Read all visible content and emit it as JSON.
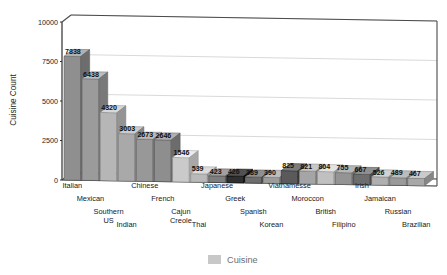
{
  "chart_data": {
    "type": "bar",
    "title": "",
    "subtitle": "",
    "xlabel": "Cuisine",
    "ylabel": "Cuisine Count",
    "ylim": [
      0,
      10000
    ],
    "yticks": [
      0,
      2500,
      5000,
      7500,
      10000
    ],
    "ytick_labels": [
      "0",
      "2500",
      "5000",
      "7500",
      "10000"
    ],
    "grid": true,
    "legend_position": "bottom",
    "legend": [
      "Cuisine"
    ],
    "style": "3d-bar",
    "categories": [
      "Italian",
      "Mexican",
      "Southern US",
      "Indian",
      "Chinese",
      "French",
      "Cajun Creole",
      "Thai",
      "Japanese",
      "Greek",
      "Spanish",
      "Korean",
      "Viatnamesse",
      "Moroccon",
      "British",
      "Filipino",
      "Irish",
      "Jamaican",
      "Russian",
      "Brazilian"
    ],
    "values": [
      7838,
      6438,
      4320,
      3003,
      2673,
      2646,
      1546,
      539,
      423,
      426,
      389,
      390,
      825,
      821,
      804,
      755,
      667,
      526,
      489,
      467
    ],
    "value_labels": [
      "7838",
      "6438",
      "4320",
      "3003",
      "2673",
      "2646",
      "1546",
      "539",
      "423",
      "426",
      "389",
      "390",
      "825",
      "821",
      "804",
      "755",
      "667",
      "526",
      "489",
      "467"
    ],
    "bar_colors": [
      "#8f8f8f",
      "#9b9b9b",
      "#b6b6b6",
      "#a9a9a9",
      "#989898",
      "#8e8e8e",
      "#cacaca",
      "#b9b9b9",
      "#7e7e7e",
      "#2f2f2f",
      "#6e6e6e",
      "#9c9c9c",
      "#5a5a5a",
      "#a5a5a5",
      "#c0c0c0",
      "#949494",
      "#6d6d6d",
      "#b0b0b0",
      "#9a9a9a",
      "#a8a8a8"
    ],
    "legend_swatch_color": "#c8c8c8",
    "axis_color": "#2e2e2e",
    "grid_color": "#c9c9c9",
    "background_color": "#ffffff"
  },
  "axis": {
    "y_title": "Cuisine Count"
  }
}
